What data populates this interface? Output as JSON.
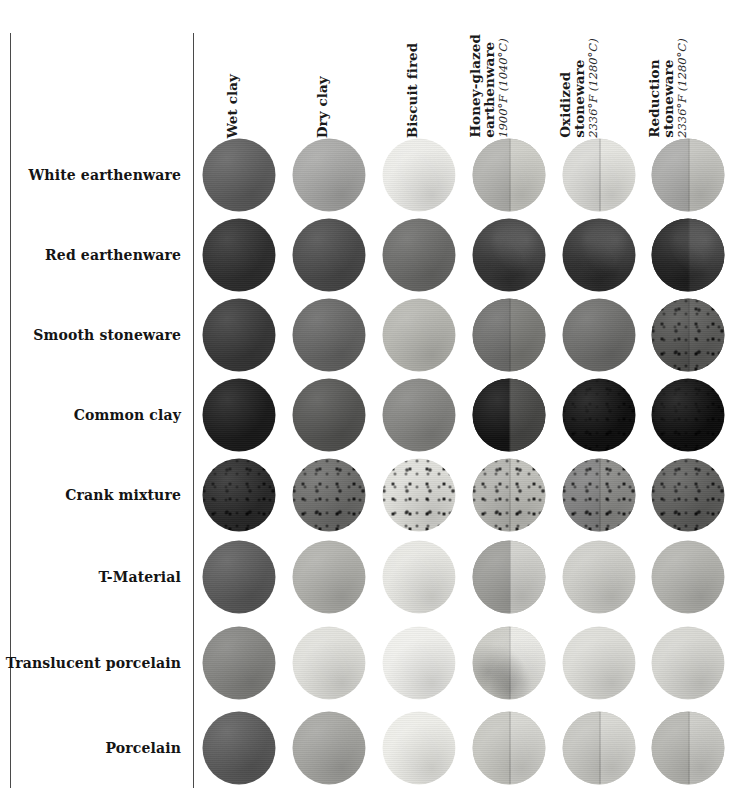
{
  "figure": {
    "type": "sample-grid-table",
    "rows": 8,
    "cols": 6
  },
  "columns": [
    {
      "id": "wet-clay",
      "main": "Wet clay",
      "sub": ""
    },
    {
      "id": "dry-clay",
      "main": "Dry clay",
      "sub": ""
    },
    {
      "id": "biscuit-fired",
      "main": "Biscuit fired",
      "sub": ""
    },
    {
      "id": "honey-glazed-earthenware",
      "main": "Honey-glazed\nearthenware",
      "sub": "1900°F (1040°C)"
    },
    {
      "id": "oxidized-stoneware",
      "main": "Oxidized\nstoneware",
      "sub": "2336°F (1280°C)"
    },
    {
      "id": "reduction-stoneware",
      "main": "Reduction\nstoneware",
      "sub": "2336°F (1280°C)"
    }
  ],
  "rows": [
    {
      "id": "white-earthenware",
      "label": "White earthenware"
    },
    {
      "id": "red-earthenware",
      "label": "Red earthenware"
    },
    {
      "id": "smooth-stoneware",
      "label": "Smooth stoneware"
    },
    {
      "id": "common-clay",
      "label": "Common clay"
    },
    {
      "id": "crank-mixture",
      "label": "Crank mixture"
    },
    {
      "id": "t-material",
      "label": "T-Material"
    },
    {
      "id": "translucent-porcelain",
      "label": "Translucent porcelain"
    },
    {
      "id": "porcelain",
      "label": "Porcelain"
    }
  ],
  "samples": [
    [
      {
        "color": "#5e5e5e"
      },
      {
        "color": "#a9a9a7"
      },
      {
        "color": "#eeeeea"
      },
      {
        "color": "#b4b4b0",
        "right": "#cfcfc9",
        "split": true
      },
      {
        "color": "#dadad6",
        "right": "#e6e6e1",
        "split": true
      },
      {
        "color": "#acacaa",
        "right": "#c6c6c1",
        "split": true
      }
    ],
    [
      {
        "color": "#2f2f2f"
      },
      {
        "color": "#4a4a4a"
      },
      {
        "color": "#6b6b69"
      },
      {
        "color": "#3a3a3a",
        "mottle": true
      },
      {
        "color": "#333333",
        "mottle": true
      },
      {
        "color": "#242424",
        "mottle": true,
        "right": "#3a3a3a",
        "split": true
      }
    ],
    [
      {
        "color": "#383838"
      },
      {
        "color": "#666665"
      },
      {
        "color": "#b8b8b2"
      },
      {
        "color": "#6f6f6d",
        "right": "#7d7d79",
        "split": true
      },
      {
        "color": "#6e6e6c"
      },
      {
        "color": "#525250",
        "speckle": true,
        "right": "#5e5e5c",
        "split": true
      }
    ],
    [
      {
        "color": "#1b1b1b"
      },
      {
        "color": "#555553"
      },
      {
        "color": "#858582"
      },
      {
        "color": "#131313",
        "right": "#4a4a48",
        "split": true
      },
      {
        "color": "#101010",
        "speckle": true
      },
      {
        "color": "#0e0e0e",
        "speckle": true
      }
    ],
    [
      {
        "color": "#2a2a2a",
        "speckle": true
      },
      {
        "color": "#6d6d6b",
        "speckle": true
      },
      {
        "color": "#e0e0db",
        "speckle": true
      },
      {
        "color": "#b3b3ae",
        "speckle": true,
        "right": "#c3c3bd",
        "split": true
      },
      {
        "color": "#808080",
        "speckle": true,
        "right": "#8d8d8a",
        "split": true
      },
      {
        "color": "#5f5f5d",
        "speckle": true
      }
    ],
    [
      {
        "color": "#5a5a5a"
      },
      {
        "color": "#b1b1ac"
      },
      {
        "color": "#e9e9e4"
      },
      {
        "color": "#9d9d99",
        "right": "#d2d2cd",
        "split": true
      },
      {
        "color": "#cfcfca"
      },
      {
        "color": "#b5b5b0"
      }
    ],
    [
      {
        "color": "#848481"
      },
      {
        "color": "#e2e2dd"
      },
      {
        "color": "#f1f1ed"
      },
      {
        "color": "#cbcbc5",
        "mottle": true,
        "right": "#eaeae5",
        "split": true
      },
      {
        "color": "#dedeD9"
      },
      {
        "color": "#d8d8d3"
      }
    ],
    [
      {
        "color": "#5a5a5a"
      },
      {
        "color": "#a6a6a2"
      },
      {
        "color": "#efefea"
      },
      {
        "color": "#c8c8c2",
        "right": "#d8d8d3",
        "split": true
      },
      {
        "color": "#c7c7c2",
        "right": "#d9d9d4",
        "split": true
      },
      {
        "color": "#b6b6b1",
        "right": "#cdcdc8",
        "split": true
      }
    ]
  ],
  "geometry": {
    "col_x": [
      239,
      329,
      419,
      509,
      599,
      688
    ],
    "row_y": [
      175,
      255,
      335,
      415,
      495,
      577,
      663,
      748
    ],
    "disc_diameter": 73,
    "rule_left_x": 10,
    "rule_mid_x": 193,
    "rule_top_y": 33,
    "rule_bottom_y": 788
  },
  "colors": {
    "background": "#ffffff",
    "rule": "#4a4a4a",
    "text": "#141414"
  }
}
